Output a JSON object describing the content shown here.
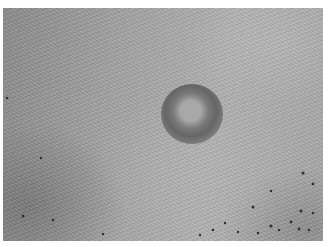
{
  "image": {
    "description": "Grayscale close-up photograph of skin texture with a circular ring-shaped lesion near center and dark pore dots in the lower right",
    "colors": {
      "border": "#ffffff",
      "skin_light": "#b2b2b2",
      "skin_dark": "#8c8c8c",
      "lesion_ring": "#666666",
      "lesion_center": "#a8a8a8",
      "dots": "#333333"
    }
  }
}
